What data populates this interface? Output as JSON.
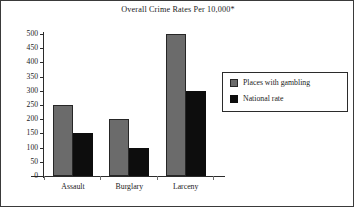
{
  "figure": {
    "title": "Overall Crime Rates Per 10,000*",
    "background_color": "#ffffff",
    "frame_color": "#3a3a3a"
  },
  "legend": {
    "position": "right",
    "entries": [
      {
        "label": "Places with gambling",
        "color": "#6b6b6b",
        "swatch": "gray-swatch-icon"
      },
      {
        "label": "National rate",
        "color": "#0d0d0d",
        "swatch": "black-swatch-icon"
      }
    ]
  },
  "axes": {
    "y_ticks": [
      "0",
      "50",
      "100",
      "150",
      "200",
      "250",
      "300",
      "350",
      "400",
      "450",
      "500"
    ],
    "x_ticks": [
      "Assault",
      "Burglary",
      "Larceny"
    ]
  },
  "chart_data": {
    "type": "bar",
    "title": "Overall Crime Rates Per 10,000*",
    "xlabel": "",
    "ylabel": "",
    "categories": [
      "Assault",
      "Burglary",
      "Larceny"
    ],
    "series": [
      {
        "name": "Places with gambling",
        "color": "#6b6b6b",
        "values": [
          250,
          200,
          500
        ]
      },
      {
        "name": "National rate",
        "color": "#0d0d0d",
        "values": [
          150,
          100,
          300
        ]
      }
    ],
    "ylim": [
      0,
      500
    ],
    "ytick_step": 50,
    "ytick_values": [
      0,
      50,
      100,
      150,
      200,
      250,
      300,
      350,
      400,
      450,
      500
    ],
    "grid": false,
    "legend_position": "right",
    "annotations": [
      "*"
    ]
  }
}
